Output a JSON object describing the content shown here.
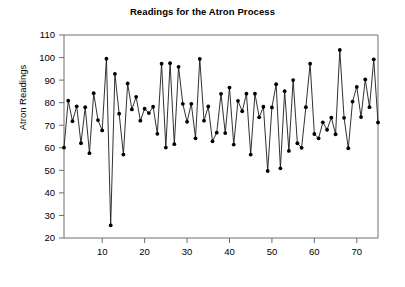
{
  "chart_data": {
    "type": "line",
    "title": "Readings for the Atron Process",
    "xlabel": "",
    "ylabel": "Atron Readings",
    "xlim": [
      1,
      75
    ],
    "ylim": [
      20,
      110
    ],
    "xticks": [
      10,
      20,
      30,
      40,
      50,
      60,
      70
    ],
    "yticks": [
      20,
      30,
      40,
      50,
      60,
      70,
      80,
      90,
      100,
      110
    ],
    "grid": false,
    "legend": null,
    "marker": "filled-circle",
    "line_color": "#1a1a1a",
    "marker_color": "#000000",
    "x": [
      1,
      2,
      3,
      4,
      5,
      6,
      7,
      8,
      9,
      10,
      11,
      12,
      13,
      14,
      15,
      16,
      17,
      18,
      19,
      20,
      21,
      22,
      23,
      24,
      25,
      26,
      27,
      28,
      29,
      30,
      31,
      32,
      33,
      34,
      35,
      36,
      37,
      38,
      39,
      40,
      41,
      42,
      43,
      44,
      45,
      46,
      47,
      48,
      49,
      50,
      51,
      52,
      53,
      54,
      55,
      56,
      57,
      58,
      59,
      60,
      61,
      62,
      63,
      64,
      65,
      66,
      67,
      68,
      69,
      70,
      71,
      72,
      73,
      74,
      75
    ],
    "values": [
      60.1,
      80.9,
      71.8,
      78.4,
      62.0,
      78.0,
      57.6,
      84.2,
      72.3,
      67.7,
      99.5,
      25.6,
      92.8,
      75.1,
      57.0,
      88.5,
      77.0,
      82.6,
      72.0,
      77.3,
      75.4,
      78.2,
      66.2,
      97.3,
      60.1,
      97.5,
      61.6,
      95.9,
      79.5,
      71.5,
      79.5,
      64.2,
      99.4,
      72.0,
      78.3,
      62.9,
      66.7,
      83.9,
      66.5,
      86.7,
      61.4,
      80.8,
      76.2,
      84.0,
      57.0,
      84.0,
      73.5,
      78.2,
      49.7,
      77.9,
      88.2,
      50.9,
      85.1,
      58.6,
      90.0,
      62.0,
      60.0,
      78.0,
      97.3,
      66.1,
      64.2,
      71.3,
      68.0,
      73.4,
      66.0,
      103.4,
      73.3,
      59.8,
      80.5,
      87.0,
      73.6,
      90.3,
      78.0,
      99.2,
      71.2
    ]
  },
  "ticks": {
    "y": [
      "110",
      "100",
      "90",
      "80",
      "70",
      "60",
      "50",
      "40",
      "30",
      "20"
    ],
    "x": [
      "10",
      "20",
      "30",
      "40",
      "50",
      "60",
      "70"
    ]
  }
}
